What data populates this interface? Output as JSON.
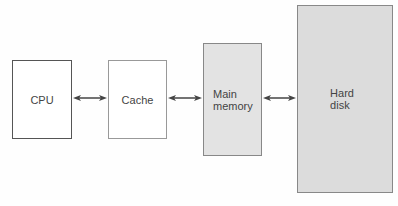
{
  "diagram": {
    "nodes": [
      {
        "id": "cpu",
        "label": "CPU"
      },
      {
        "id": "cache",
        "label": "Cache"
      },
      {
        "id": "main_memory",
        "label_line1": "Main",
        "label_line2": "memory"
      },
      {
        "id": "hard_disk",
        "label_line1": "Hard",
        "label_line2": "disk"
      }
    ],
    "edges": [
      {
        "from": "cpu",
        "to": "cache",
        "type": "bidirectional"
      },
      {
        "from": "cache",
        "to": "main_memory",
        "type": "bidirectional"
      },
      {
        "from": "main_memory",
        "to": "hard_disk",
        "type": "bidirectional"
      }
    ],
    "colors": {
      "cpu_border": "#555555",
      "cache_border": "#999999",
      "main_memory_fill": "#e3e3e3",
      "hard_disk_fill": "#dcdcdc",
      "arrow": "#444444"
    }
  }
}
